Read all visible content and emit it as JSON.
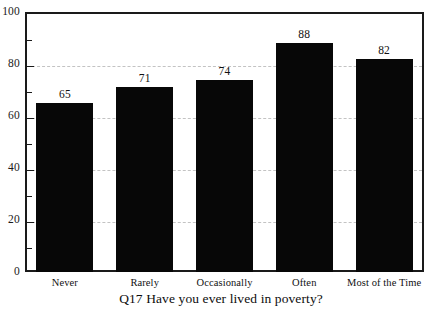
{
  "chart_data": {
    "type": "bar",
    "title": "",
    "xlabel": "Q17 Have you ever lived in poverty?",
    "ylabel": "",
    "categories": [
      "Never",
      "Rarely",
      "Occasionally",
      "Often",
      "Most of the Time"
    ],
    "values": [
      65,
      71,
      74,
      88,
      82
    ],
    "ylim": [
      0,
      100
    ],
    "y_ticks": [
      0,
      20,
      40,
      60,
      80,
      100
    ],
    "y_tick_labels": [
      "0",
      "20",
      "40",
      "60",
      "80",
      "100"
    ],
    "y_minor_ticks": [
      10,
      30,
      50,
      70,
      90
    ],
    "gridlines": [
      20,
      40,
      60,
      80
    ],
    "grid": true,
    "legend": "none",
    "bar_color": "#070707",
    "frame_color": "#1a1a1a",
    "grid_color": "#b9b9b9",
    "show_value_labels": true
  }
}
